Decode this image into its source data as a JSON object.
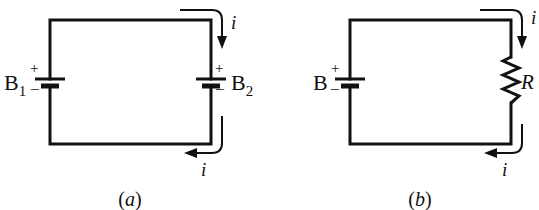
{
  "figure": {
    "type": "circuit-diagram",
    "panels": [
      {
        "id": "a",
        "caption": "(a)",
        "caption_letter": "a",
        "components": [
          {
            "type": "battery",
            "label": "B",
            "subscript": "1",
            "positive": "+",
            "negative": "−",
            "position": "left"
          },
          {
            "type": "battery",
            "label": "B",
            "subscript": "2",
            "positive": "+",
            "negative": "−",
            "position": "right"
          }
        ],
        "current_arrows": [
          {
            "label": "i",
            "position": "top-right",
            "direction": "down"
          },
          {
            "label": "i",
            "position": "bottom-right",
            "direction": "left"
          }
        ]
      },
      {
        "id": "b",
        "caption": "(b)",
        "caption_letter": "b",
        "components": [
          {
            "type": "battery",
            "label": "B",
            "positive": "+",
            "negative": "−",
            "position": "left"
          },
          {
            "type": "resistor",
            "label": "R",
            "position": "right"
          }
        ],
        "current_arrows": [
          {
            "label": "i",
            "position": "top-right",
            "direction": "down"
          },
          {
            "label": "i",
            "position": "bottom-right",
            "direction": "left"
          }
        ]
      }
    ]
  },
  "labels": {
    "a": {
      "b1_letter": "B",
      "b1_sub": "1",
      "b1_plus": "+",
      "b1_minus": "−",
      "b2_letter": "B",
      "b2_sub": "2",
      "b2_plus": "+",
      "b2_minus": "−",
      "current_top": "i",
      "current_bottom": "i",
      "caption_open": "(",
      "caption_letter": "a",
      "caption_close": ")"
    },
    "b": {
      "b_letter": "B",
      "b_plus": "+",
      "b_minus": "−",
      "resistor": "R",
      "current_top": "i",
      "current_bottom": "i",
      "caption_open": "(",
      "caption_letter": "b",
      "caption_close": ")"
    }
  }
}
